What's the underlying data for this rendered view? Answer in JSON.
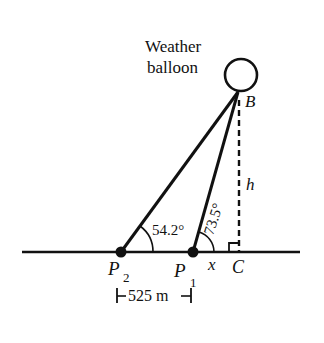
{
  "diagram": {
    "title_label_line1": "Weather",
    "title_label_line2": "balloon",
    "points": {
      "B": "B",
      "P2": "P",
      "P2_sub": "2",
      "P1": "P",
      "P1_sub": "1",
      "C": "C"
    },
    "variables": {
      "height": "h",
      "base_distance": "x"
    },
    "angles": {
      "at_P2": "54.2°",
      "at_P1": "73.5°"
    },
    "distance_label": "525 m",
    "colors": {
      "stroke": "#111111",
      "background": "#ffffff"
    }
  }
}
